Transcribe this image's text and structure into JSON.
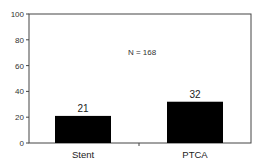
{
  "chart_data": {
    "type": "bar",
    "title": "",
    "xlabel": "",
    "ylabel": "",
    "categories": [
      "Stent",
      "PTCA"
    ],
    "values": [
      21,
      32
    ],
    "value_labels": [
      "21",
      "32"
    ],
    "ylim": [
      0,
      100
    ],
    "yticks": [
      0,
      20,
      40,
      60,
      80,
      100
    ],
    "ytick_labels": [
      "0",
      "20",
      "40",
      "60",
      "80",
      "100"
    ],
    "annotation": "N = 168",
    "grid": false,
    "legend": null,
    "bar_color": "#000000"
  }
}
